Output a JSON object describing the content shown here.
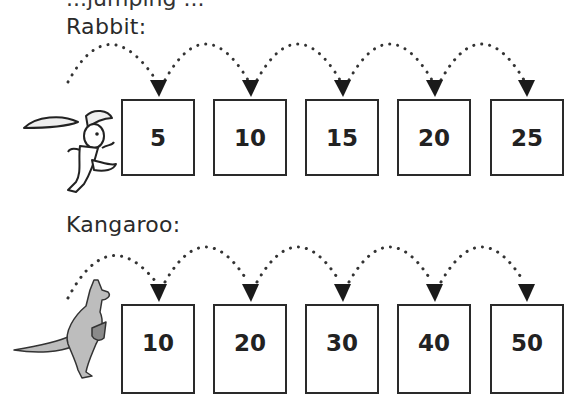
{
  "header": {
    "cut_off_text": "...jumping ..."
  },
  "rabbit": {
    "label": "Rabbit:",
    "animal_icon": "rabbit-illustration",
    "step": 5,
    "boxes": [
      "5",
      "10",
      "15",
      "20",
      "25"
    ]
  },
  "kangaroo": {
    "label": "Kangaroo:",
    "animal_icon": "kangaroo-illustration",
    "step": 10,
    "boxes": [
      "10",
      "20",
      "30",
      "40",
      "50"
    ]
  },
  "colors": {
    "ink": "#2a2a2a",
    "kangaroo_fill": "#bdbdbd",
    "background": "#ffffff"
  }
}
